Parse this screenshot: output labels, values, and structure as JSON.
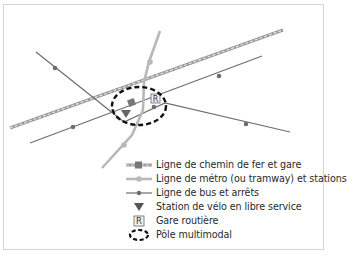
{
  "diagram": {
    "colors": {
      "rail": "#9a9a9a",
      "rail_dash": "#e6e6e6",
      "metro": "#b8b8b8",
      "bus": "#6e6e6e",
      "hub_outline": "#111111",
      "border": "#d4d4d4",
      "text": "#2a2a2a"
    },
    "legend": {
      "items": [
        {
          "symbol": "rail-line-with-station-icon",
          "label": "Ligne de chemin de fer et gare"
        },
        {
          "symbol": "metro-line-with-station-icon",
          "label": "Ligne de métro (ou tramway) et stations"
        },
        {
          "symbol": "bus-line-with-stop-icon",
          "label": "Ligne de bus et arrêts"
        },
        {
          "symbol": "bike-station-triangle-icon",
          "label": "Station de vélo en libre service"
        },
        {
          "symbol": "bus-terminal-r-icon",
          "label": "Gare routière"
        },
        {
          "symbol": "multimodal-hub-ellipse-icon",
          "label": "Pôle multimodal"
        }
      ]
    },
    "map_symbols": {
      "bus_terminal_letter": "R"
    }
  }
}
